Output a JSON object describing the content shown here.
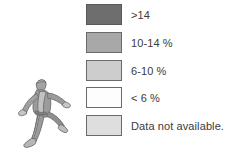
{
  "figure": {
    "type": "map-legend",
    "background_color": "#ffffff",
    "illustration": {
      "name": "running-person",
      "description": "Gray silhouette of a leaping/running person",
      "body_color": "#9b9b9b",
      "highlight_color": "#c4c4c4",
      "shadow_color": "#7d7d7d",
      "outline_color": "#6f6f6f"
    }
  },
  "legend": {
    "items": [
      {
        "label": ">14",
        "color": "#6e6e6e",
        "border": "#5a5a5a"
      },
      {
        "label": "10-14 %",
        "color": "#a8a8a8",
        "border": "#6a6a6a"
      },
      {
        "label": "6-10 %",
        "color": "#cdcdcd",
        "border": "#6a6a6a"
      },
      {
        "label": "< 6 %",
        "color": "#fdfdfd",
        "border": "#6a6a6a"
      },
      {
        "label": "Data not available.",
        "color": "#dedede",
        "border": "#6a6a6a"
      }
    ]
  }
}
